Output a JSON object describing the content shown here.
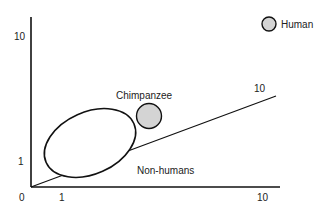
{
  "diagram": {
    "axis_ticks": {
      "origin": "0",
      "x_one": "1",
      "x_ten": "10",
      "y_one": "1",
      "y_ten": "10",
      "diag_ten": "10"
    },
    "labels": {
      "chimpanzee": "Chimpanzee",
      "non_humans": "Non-humans",
      "human": "Human"
    },
    "colors": {
      "line": "#111111",
      "marker_fill": "#d4d4d4"
    }
  }
}
